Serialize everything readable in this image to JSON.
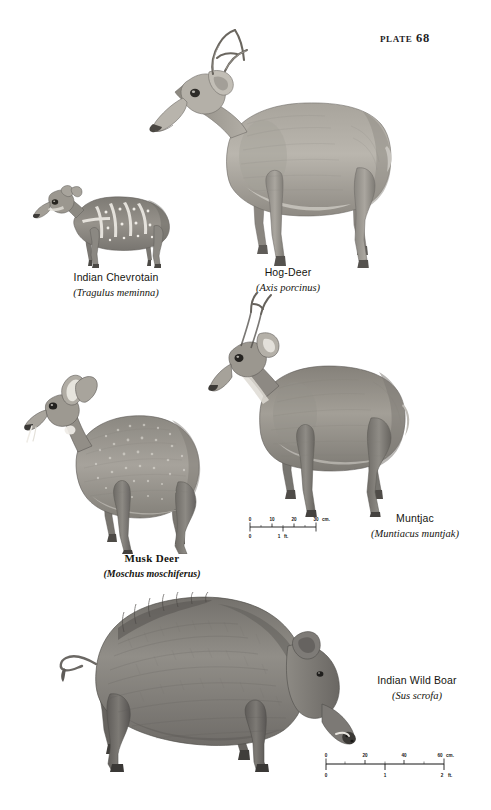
{
  "plate": {
    "label": "Plate 68"
  },
  "figures": [
    {
      "id": "indian-chevrotain",
      "common_name": "Indian Chevrotain",
      "scientific_name": "(Tragulus meminna)"
    },
    {
      "id": "hog-deer",
      "common_name": "Hog-Deer",
      "scientific_name": "(Axis porcinus)"
    },
    {
      "id": "musk-deer",
      "common_name": "Musk Deer",
      "scientific_name": "(Moschus moschiferus)"
    },
    {
      "id": "muntjac",
      "common_name": "Muntjac",
      "scientific_name": "(Muntiacus muntjak)"
    },
    {
      "id": "indian-wild-boar",
      "common_name": "Indian Wild Boar",
      "scientific_name": "(Sus scrofa)"
    }
  ],
  "scale_bars": [
    {
      "id": "upper-scale",
      "cm_ticks": [
        "0",
        "10",
        "20",
        "30"
      ],
      "cm_unit": "cm.",
      "ft_ticks": [
        "0",
        "1"
      ],
      "ft_unit": "ft."
    },
    {
      "id": "lower-scale",
      "cm_ticks": [
        "0",
        "20",
        "40",
        "60"
      ],
      "cm_unit": "cm.",
      "ft_ticks": [
        "0",
        "1",
        "2"
      ],
      "ft_unit": "ft."
    }
  ],
  "colors": {
    "page_background": "#ffffff",
    "ink": "#15150f",
    "illustration_mid": "#9a968f",
    "illustration_dark": "#4e4b46",
    "illustration_light": "#c9c6c0"
  }
}
